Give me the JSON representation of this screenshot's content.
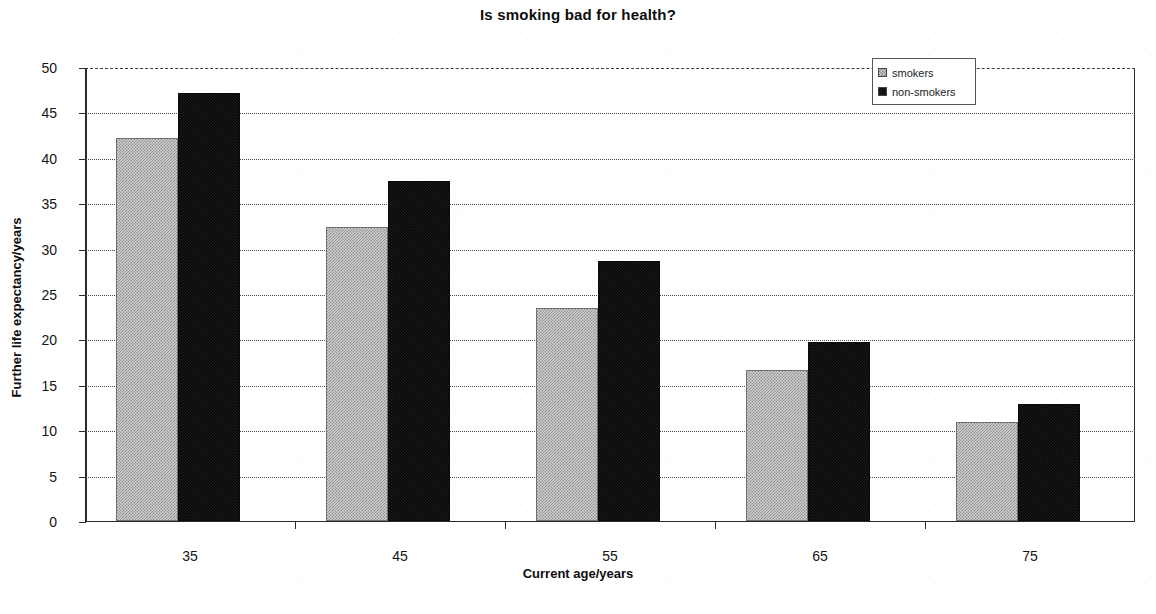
{
  "chart_data": {
    "type": "bar",
    "title": "Is smoking bad for health?",
    "xlabel": "Current age/years",
    "ylabel": "Further life expectancy/years",
    "categories": [
      "35",
      "45",
      "55",
      "65",
      "75"
    ],
    "series": [
      {
        "name": "smokers",
        "values": [
          42.1,
          32.3,
          23.4,
          16.6,
          10.9
        ]
      },
      {
        "name": "non-smokers",
        "values": [
          47.1,
          37.4,
          28.6,
          19.7,
          12.8
        ]
      }
    ],
    "ylim": [
      0,
      50
    ],
    "yticks": [
      "50",
      "45",
      "40",
      "35",
      "30",
      "25",
      "20",
      "15",
      "10",
      "5",
      "0"
    ],
    "ytick_values": [
      50,
      45,
      40,
      35,
      30,
      25,
      20,
      15,
      10,
      5,
      0
    ],
    "grid": true,
    "grid_axis": "y",
    "legend_position": "top-right",
    "colors": {
      "smokers": "#c9c9c9",
      "non_smokers": "#1a1a1a",
      "axis": "#2a2a2a",
      "grid": "#4a4a4a",
      "text": "#111111",
      "background": "#ffffff"
    }
  },
  "legend": {
    "items": [
      {
        "label": "smokers",
        "swatch": "smokers"
      },
      {
        "label": "non-smokers",
        "swatch": "nonsmokers"
      }
    ]
  }
}
